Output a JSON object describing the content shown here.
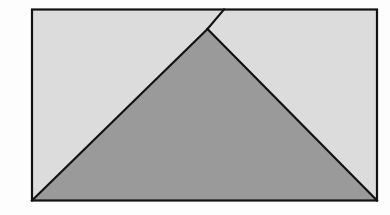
{
  "canvas": {
    "width": 390,
    "height": 215,
    "background_color": "#fdfdfd"
  },
  "figure": {
    "stroke_color": "#121212",
    "stroke_width": 2.2,
    "rectangle": {
      "name": "outer-rectangle",
      "fill_color": "#dcdcdc",
      "x": 32,
      "y": 9.5,
      "width": 345,
      "height": 191,
      "corners": {
        "top_left": [
          32,
          9.5
        ],
        "top_right": [
          377,
          9.5
        ],
        "bottom_right": [
          377,
          200.5
        ],
        "bottom_left": [
          32,
          200.5
        ]
      }
    },
    "shaded_triangle": {
      "name": "shaded-triangle",
      "fill_color": "#9a9a9a",
      "points": "207.5,29 377,200.5 32,200.5",
      "vertices": {
        "apex": [
          207.5,
          29
        ],
        "base_right": [
          377,
          200.5
        ],
        "base_left": [
          32,
          200.5
        ]
      }
    },
    "extra_line": {
      "name": "apex-extension-line",
      "description": "left side of triangle extended past apex to the top edge of the rectangle",
      "x1": 207.5,
      "y1": 29,
      "x2": 224,
      "y2": 9.5
    }
  },
  "labels": {
    "none_visible": ""
  }
}
